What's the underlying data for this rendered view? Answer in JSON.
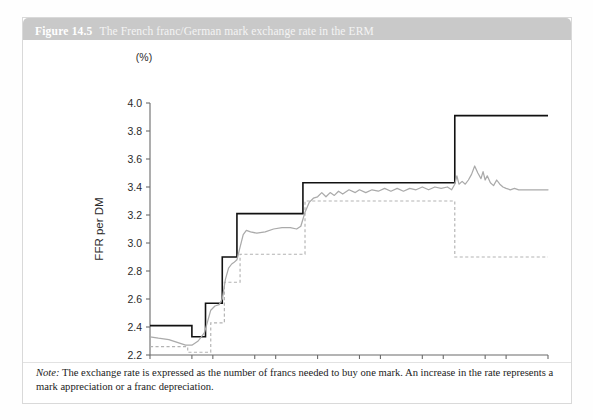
{
  "figure": {
    "number": "Figure 14.5",
    "title": "The French franc/German mark exchange rate in the ERM",
    "note_prefix": "Note:",
    "note_text": " The exchange rate is expressed as the number of francs needed to buy one mark. An increase in the rate represents a mark appreciation or a franc depreciation."
  },
  "colors": {
    "title_band": "#c9c9c9",
    "upper_band": "#111111",
    "lower_band": "#b3b3b3",
    "rate_line": "#aaaaaa",
    "axis": "#6b6b6b",
    "card_border": "#d9d9d9"
  },
  "chart_data": {
    "type": "line",
    "title": "The French franc/German mark exchange rate in the ERM",
    "xlabel": "",
    "ylabel": "FFR per DM",
    "unit_label": "(%)",
    "xlim": [
      1979,
      1998
    ],
    "ylim": [
      2.2,
      4.0
    ],
    "yticks": [
      "2.2",
      "2.4",
      "2.6",
      "2.8",
      "3.0",
      "3.2",
      "3.4",
      "3.6",
      "3.8",
      "4.0"
    ],
    "xticks": [
      "1979",
      "1981",
      "1982",
      "1984",
      "1985",
      "1987",
      "1989",
      "1990",
      "1992",
      "1993",
      "1995",
      "1996",
      "1998"
    ],
    "xtick_values": [
      1979,
      1981,
      1982,
      1984,
      1985,
      1987,
      1989,
      1990,
      1992,
      1993,
      1995,
      1996,
      1998
    ],
    "grid": false,
    "legend": "none",
    "series": [
      {
        "name": "ERM upper band (ceiling)",
        "style": "solid-black-step",
        "points": [
          [
            1979.0,
            2.41
          ],
          [
            1981.0,
            2.41
          ],
          [
            1981.0,
            2.33
          ],
          [
            1981.65,
            2.33
          ],
          [
            1981.65,
            2.57
          ],
          [
            1982.45,
            2.57
          ],
          [
            1982.45,
            2.9
          ],
          [
            1983.15,
            2.9
          ],
          [
            1983.15,
            3.21
          ],
          [
            1986.3,
            3.21
          ],
          [
            1986.3,
            3.43
          ],
          [
            1993.55,
            3.43
          ],
          [
            1993.55,
            3.91
          ],
          [
            1998.0,
            3.91
          ]
        ]
      },
      {
        "name": "ERM lower band (floor)",
        "style": "dashed-grey-step",
        "points": [
          [
            1979.0,
            2.26
          ],
          [
            1980.8,
            2.26
          ],
          [
            1980.8,
            2.22
          ],
          [
            1981.9,
            2.22
          ],
          [
            1981.9,
            2.43
          ],
          [
            1982.55,
            2.43
          ],
          [
            1982.55,
            2.72
          ],
          [
            1983.3,
            2.72
          ],
          [
            1983.3,
            2.92
          ],
          [
            1986.4,
            2.92
          ],
          [
            1986.4,
            3.3
          ],
          [
            1993.55,
            3.3
          ],
          [
            1993.55,
            2.9
          ],
          [
            1998.0,
            2.9
          ]
        ]
      },
      {
        "name": "Actual FFR/DM exchange rate",
        "style": "solid-grey",
        "points": [
          [
            1979.0,
            2.33
          ],
          [
            1979.4,
            2.32
          ],
          [
            1979.9,
            2.31
          ],
          [
            1980.3,
            2.29
          ],
          [
            1980.7,
            2.27
          ],
          [
            1981.0,
            2.27
          ],
          [
            1981.3,
            2.3
          ],
          [
            1981.6,
            2.36
          ],
          [
            1981.75,
            2.44
          ],
          [
            1981.9,
            2.52
          ],
          [
            1982.1,
            2.55
          ],
          [
            1982.3,
            2.56
          ],
          [
            1982.45,
            2.6
          ],
          [
            1982.6,
            2.74
          ],
          [
            1982.75,
            2.82
          ],
          [
            1982.9,
            2.85
          ],
          [
            1983.0,
            2.86
          ],
          [
            1983.15,
            2.88
          ],
          [
            1983.3,
            2.97
          ],
          [
            1983.45,
            3.06
          ],
          [
            1983.6,
            3.09
          ],
          [
            1983.8,
            3.08
          ],
          [
            1984.1,
            3.07
          ],
          [
            1984.5,
            3.08
          ],
          [
            1984.9,
            3.1
          ],
          [
            1985.3,
            3.11
          ],
          [
            1985.7,
            3.11
          ],
          [
            1986.0,
            3.1
          ],
          [
            1986.2,
            3.12
          ],
          [
            1986.4,
            3.22
          ],
          [
            1986.6,
            3.29
          ],
          [
            1986.8,
            3.32
          ],
          [
            1987.0,
            3.33
          ],
          [
            1987.2,
            3.36
          ],
          [
            1987.4,
            3.33
          ],
          [
            1987.6,
            3.36
          ],
          [
            1987.8,
            3.34
          ],
          [
            1988.0,
            3.37
          ],
          [
            1988.2,
            3.35
          ],
          [
            1988.5,
            3.38
          ],
          [
            1988.8,
            3.36
          ],
          [
            1989.0,
            3.38
          ],
          [
            1989.3,
            3.36
          ],
          [
            1989.6,
            3.38
          ],
          [
            1989.9,
            3.37
          ],
          [
            1990.2,
            3.39
          ],
          [
            1990.5,
            3.37
          ],
          [
            1990.8,
            3.39
          ],
          [
            1991.1,
            3.37
          ],
          [
            1991.4,
            3.39
          ],
          [
            1991.7,
            3.38
          ],
          [
            1992.0,
            3.4
          ],
          [
            1992.3,
            3.38
          ],
          [
            1992.6,
            3.4
          ],
          [
            1992.9,
            3.39
          ],
          [
            1993.2,
            3.4
          ],
          [
            1993.4,
            3.38
          ],
          [
            1993.55,
            3.42
          ],
          [
            1993.65,
            3.48
          ],
          [
            1993.75,
            3.42
          ],
          [
            1993.9,
            3.44
          ],
          [
            1994.05,
            3.42
          ],
          [
            1994.2,
            3.45
          ],
          [
            1994.35,
            3.49
          ],
          [
            1994.5,
            3.55
          ],
          [
            1994.65,
            3.5
          ],
          [
            1994.8,
            3.46
          ],
          [
            1994.9,
            3.51
          ],
          [
            1995.0,
            3.45
          ],
          [
            1995.1,
            3.48
          ],
          [
            1995.25,
            3.43
          ],
          [
            1995.4,
            3.41
          ],
          [
            1995.55,
            3.45
          ],
          [
            1995.7,
            3.42
          ],
          [
            1995.85,
            3.4
          ],
          [
            1996.0,
            3.39
          ],
          [
            1996.2,
            3.38
          ],
          [
            1996.4,
            3.39
          ],
          [
            1996.6,
            3.38
          ],
          [
            1996.9,
            3.38
          ],
          [
            1997.2,
            3.38
          ],
          [
            1997.6,
            3.38
          ],
          [
            1998.0,
            3.38
          ]
        ]
      }
    ]
  }
}
